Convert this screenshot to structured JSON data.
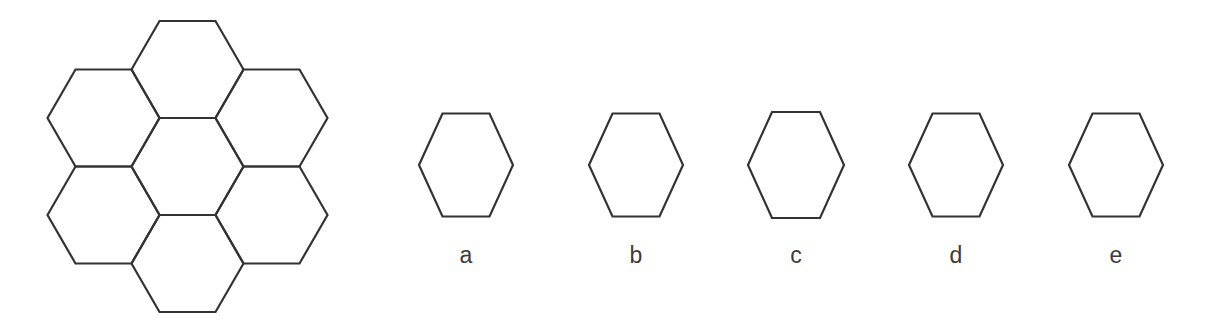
{
  "page": {
    "background_color": "#ffffff",
    "stroke_color": "#333333",
    "label_color": "#3b3b3b",
    "width": 1225,
    "height": 329
  },
  "stimulus": {
    "name": "honeycomb-cluster",
    "shape": "hexagon",
    "orientation": "flat-top",
    "cell_count": 7,
    "arrangement": "central hexagon surrounded by six hexagons",
    "bounds": {
      "x": 48,
      "y": 20,
      "width": 279,
      "height": 293
    },
    "cells": [
      {
        "id": "center",
        "cx": 187.5,
        "cy": 166.5
      },
      {
        "id": "top",
        "cx": 187.5,
        "cy": 69.5
      },
      {
        "id": "upper-left",
        "cx": 103.5,
        "cy": 118.0
      },
      {
        "id": "upper-right",
        "cx": 271.5,
        "cy": 118.0
      },
      {
        "id": "lower-left",
        "cx": 103.5,
        "cy": 215.0
      },
      {
        "id": "lower-right",
        "cx": 271.5,
        "cy": 215.0
      },
      {
        "id": "bottom",
        "cx": 187.5,
        "cy": 263.5
      }
    ],
    "cell_radius": 56,
    "stroke_width": 2.2
  },
  "options": {
    "count": 5,
    "shape": "hexagon",
    "orientation": "flat-top",
    "stroke_width": 2.2,
    "items": [
      {
        "label": "a",
        "center_x": 466,
        "center_y": 169,
        "width": 94,
        "height": 103
      },
      {
        "label": "b",
        "center_x": 636,
        "center_y": 169,
        "width": 94,
        "height": 103
      },
      {
        "label": "c",
        "center_x": 796,
        "center_y": 169,
        "width": 96,
        "height": 106
      },
      {
        "label": "d",
        "center_x": 956,
        "center_y": 169,
        "width": 94,
        "height": 103
      },
      {
        "label": "e",
        "center_x": 1116,
        "center_y": 169,
        "width": 94,
        "height": 103
      }
    ]
  }
}
